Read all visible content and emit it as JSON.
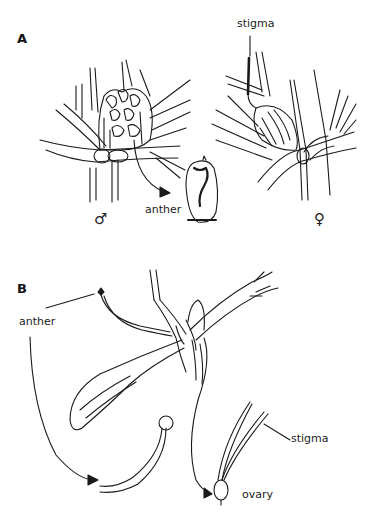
{
  "panels": {
    "a": {
      "letter": "A",
      "labels": {
        "stigma": "stigma",
        "anther": "anther"
      },
      "symbols": {
        "male": "♂",
        "female": "♀"
      }
    },
    "b": {
      "letter": "B",
      "labels": {
        "anther": "anther",
        "stigma": "stigma",
        "ovary": "ovary"
      }
    }
  },
  "colors": {
    "ink": "#1a1a1a",
    "background": "#ffffff"
  }
}
